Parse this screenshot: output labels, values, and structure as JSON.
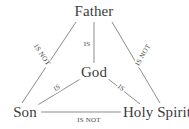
{
  "diagram": {
    "type": "trinity-shield",
    "canvas": {
      "width": 189,
      "height": 129
    },
    "colors": {
      "background": "#ffffff",
      "line": "#8d8d8d",
      "node_text": "#3c3c3c",
      "edge_text": "#4a4a4a"
    },
    "nodes": [
      {
        "id": "father",
        "label": "Father",
        "x": 94,
        "y": 11
      },
      {
        "id": "god",
        "label": "God",
        "x": 94,
        "y": 72
      },
      {
        "id": "son",
        "label": "Son",
        "x": 25,
        "y": 112
      },
      {
        "id": "holy_spirit",
        "label": "Holy Spirit",
        "x": 157,
        "y": 112
      }
    ],
    "edges": [
      {
        "id": "father-son",
        "from": "Father",
        "to": "Son",
        "label": "IS NOT",
        "x1": 76,
        "y1": 22,
        "x2": 22,
        "y2": 103,
        "label_x": 42,
        "label_y": 55,
        "label_rotation": 56
      },
      {
        "id": "father-holy-spirit",
        "from": "Father",
        "to": "Holy Spirit",
        "label": "IS NOT",
        "x1": 112,
        "y1": 22,
        "x2": 160,
        "y2": 103,
        "label_x": 143,
        "label_y": 55,
        "label_rotation": -59
      },
      {
        "id": "son-holy-spirit",
        "from": "Son",
        "to": "Holy Spirit",
        "label": "IS NOT",
        "x1": 41,
        "y1": 112,
        "x2": 133,
        "y2": 112,
        "label_x": 89,
        "label_y": 120,
        "label_rotation": 0
      },
      {
        "id": "father-god",
        "from": "Father",
        "to": "God",
        "label": "IS",
        "x1": 94,
        "y1": 22,
        "x2": 94,
        "y2": 63,
        "label_x": 87,
        "label_y": 44,
        "label_rotation": 0
      },
      {
        "id": "son-god",
        "from": "Son",
        "to": "God",
        "label": "IS",
        "x1": 36,
        "y1": 106,
        "x2": 82,
        "y2": 78,
        "label_x": 57,
        "label_y": 88,
        "label_rotation": -31
      },
      {
        "id": "holy-spirit-god",
        "from": "Holy Spirit",
        "to": "God",
        "label": "IS",
        "x1": 140,
        "y1": 104,
        "x2": 107,
        "y2": 78,
        "label_x": 121,
        "label_y": 88,
        "label_rotation": 38
      }
    ]
  }
}
